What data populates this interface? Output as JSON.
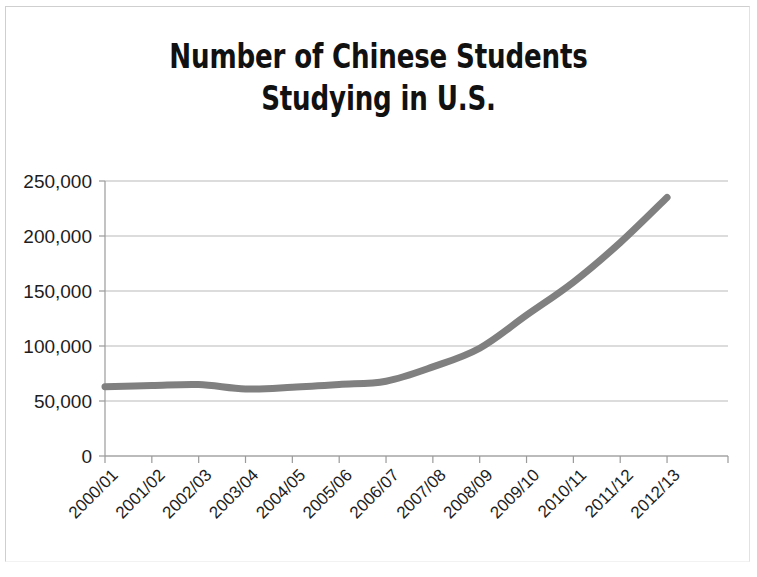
{
  "figure": {
    "title": "Number of Chinese Students\nStudying in U.S.",
    "title_line_1": "Number of Chinese Students",
    "title_line_2": "Studying in U.S.",
    "background_color": "#ffffff",
    "frame_color": "#cfcfcf"
  },
  "chart_data": {
    "type": "line",
    "title": "Number of Chinese Students Studying in U.S.",
    "xlabel": "",
    "ylabel": "",
    "categories": [
      "2000/01",
      "2001/02",
      "2002/03",
      "2003/04",
      "2004/05",
      "2005/06",
      "2006/07",
      "2007/08",
      "2008/09",
      "2009/10",
      "2010/11",
      "2011/12",
      "2012/13"
    ],
    "values": [
      63000,
      64000,
      65000,
      61000,
      62500,
      65000,
      68000,
      81000,
      98000,
      128000,
      158000,
      194000,
      235000
    ],
    "series": [
      {
        "name": "Chinese students in U.S.",
        "values": [
          63000,
          64000,
          65000,
          61000,
          62500,
          65000,
          68000,
          81000,
          98000,
          128000,
          158000,
          194000,
          235000
        ],
        "color": "#808080",
        "line_width": 7
      }
    ],
    "ylim": [
      0,
      250000
    ],
    "yticks": [
      0,
      50000,
      100000,
      150000,
      200000,
      250000
    ],
    "ytick_labels": [
      "0",
      "50,000",
      "100,000",
      "150,000",
      "200,000",
      "250,000"
    ],
    "grid": true,
    "grid_axis": "y",
    "grid_color": "#b9b9b9",
    "legend": false,
    "legend_position": "none",
    "xtick_rotation": 45,
    "axis_color": "#9a9a9a"
  }
}
